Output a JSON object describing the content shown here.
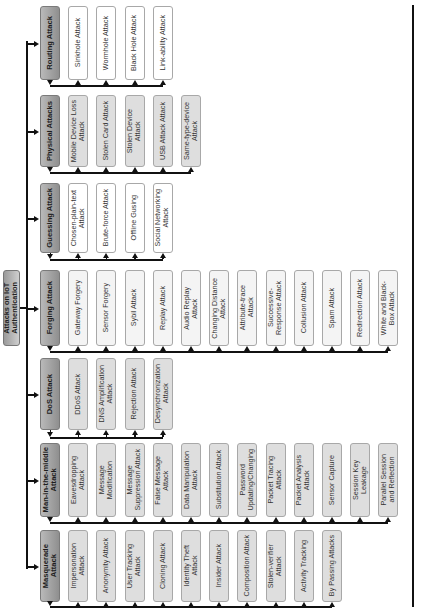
{
  "root": {
    "label": "Attacks on IoT\nAuthentication"
  },
  "categories": [
    {
      "label": "Routing Attack",
      "style": "white",
      "children": [
        "Sinkhole Attack",
        "Wormhole Attack",
        "Black Hole Attack",
        "Link-ability Attack"
      ]
    },
    {
      "label": "Physical Attacks",
      "style": "grey",
      "children": [
        "Mobile Device Loss\nAttack",
        "Stolen Card Attack",
        "Stolen Device\nAttack",
        "USB Attack Attack",
        "Same-type-device\nAttack"
      ]
    },
    {
      "label": "Guessing Attack",
      "style": "white",
      "children": [
        "Chosen-plain-text\nAttack",
        "Brute-force Attack",
        "Offline Gusing",
        "Social Networking\nAttack"
      ]
    },
    {
      "label": "Forging Attack",
      "style": "light",
      "children": [
        "Gateway Forgery",
        "Sensor Forgery",
        "Sybil Attack",
        "Replay Attack",
        "Audio Replay\nAttack",
        "Changing Distance\nAttack",
        "Attribute-trace\nAttack",
        "Successive-\nResponse Attack",
        "Collusion Attack",
        "Spam Attack",
        "Redirection Attack",
        "White and Black-\nBox Attack"
      ]
    },
    {
      "label": "DoS Attack",
      "style": "grey",
      "children": [
        "DDoS Attack",
        "DNS Amplification\nAttack",
        "Rejection Attack",
        "Desynchronization\nAttack"
      ]
    },
    {
      "label": "Man-in-the-middle\nAttack",
      "style": "grey",
      "children": [
        "Eavesdropping\nAttack",
        "Message\nModification",
        "Message\nSuppression Attack",
        "False Message\nAttack",
        "Data Manipulation\nAttack",
        "Substitution Attack",
        "Password\nUpdating/Changing",
        "Packet Tracing\nAttack",
        "Packet Analysis\nAttack",
        "Sensor Capture",
        "Session Key\nLeakage",
        "Parallel Session\nand Reflection"
      ]
    },
    {
      "label": "Masquerade\nAttack",
      "style": "grey",
      "children": [
        "Impersonation\nAttack",
        "Anonymity Attack",
        "User Tracking\nAttack",
        "Cloning Attack",
        "Identity Theft\nAttack",
        "Insider Attack",
        "Composition Attack",
        "Stolen-verifier\nAttack",
        "Activity Tracking",
        "By Passing Attacks"
      ]
    }
  ]
}
